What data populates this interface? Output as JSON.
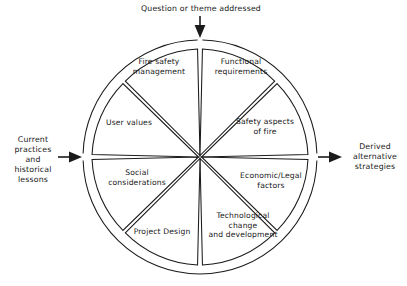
{
  "diagram": {
    "type": "cyclic-sector-wheel",
    "geometry": {
      "center_x": 200,
      "center_y": 157,
      "outer_ring_radius": 117,
      "wedge_radius": 108,
      "wedge_count": 8,
      "gap_degrees": 2.6
    },
    "colors": {
      "stroke": "#1b1b1b",
      "fill": "#ffffff",
      "text": "#171717",
      "background": "#ffffff"
    },
    "inputs": {
      "top": {
        "label": "Question or theme addressed",
        "direction": "down",
        "target": "wheel-top"
      },
      "left": {
        "label": "Current\npractices\nand\nhistorical\nlessons",
        "direction": "right",
        "target": "wheel-left"
      }
    },
    "outputs": {
      "right": {
        "label": "Derived\nalternative\nstrategies",
        "direction": "right",
        "source": "wheel-right"
      }
    },
    "wedges": [
      {
        "id": "fire-safety-management",
        "label": "Fire safety\nmanagement",
        "position": "top-left",
        "index": 0
      },
      {
        "id": "functional-requirements",
        "label": "Functional\nrequirements",
        "position": "top-right",
        "index": 1
      },
      {
        "id": "safety-aspects-of-fire",
        "label": "Safety aspects\nof fire",
        "position": "right-upper",
        "index": 2
      },
      {
        "id": "economic-legal-factors",
        "label": "Economic/Legal\nfactors",
        "position": "right-lower",
        "index": 3
      },
      {
        "id": "technological-change-and-development",
        "label": "Technological\nchange\nand development",
        "position": "bottom-right",
        "index": 4
      },
      {
        "id": "project-design",
        "label": "Project Design",
        "position": "bottom-left",
        "index": 5
      },
      {
        "id": "social-considerations",
        "label": "Social\nconsiderations",
        "position": "left-lower",
        "index": 6
      },
      {
        "id": "user-values",
        "label": "User values",
        "position": "left-upper",
        "index": 7
      }
    ]
  }
}
